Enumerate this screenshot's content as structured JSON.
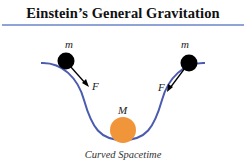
{
  "title": "Einstein’s General Gravitation",
  "labels": {
    "mass_left": "m",
    "mass_right": "m",
    "force_left": "F",
    "force_right": "F",
    "central_mass": "M",
    "caption": "Curved Spacetime"
  },
  "colors": {
    "rule": "#8fa4d6",
    "curve": "#4a5bb0",
    "small_mass": "#000000",
    "central_mass": "#f0953a"
  }
}
